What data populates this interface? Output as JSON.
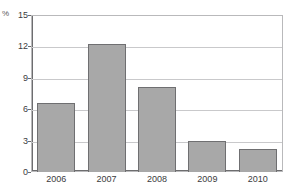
{
  "top_crop_text": "",
  "chart_data": {
    "type": "bar",
    "title": "",
    "subtitle": "",
    "xlabel": "",
    "ylabel": "",
    "unit_label": "%",
    "categories": [
      "2006",
      "2007",
      "2008",
      "2009",
      "2010"
    ],
    "values": [
      6.6,
      12.2,
      8.1,
      2.95,
      2.2
    ],
    "series": [
      {
        "name": "",
        "values": [
          6.6,
          12.2,
          8.1,
          2.95,
          2.2
        ]
      }
    ],
    "ylim": [
      0,
      15
    ],
    "yticks": [
      0,
      3,
      6,
      9,
      12,
      15
    ],
    "ytick_labels": [
      "0",
      "3",
      "6",
      "9",
      "12",
      "15"
    ],
    "grid": true,
    "grid_axis": "y",
    "legend": false,
    "legend_position": "none",
    "bar_color": "#a8a8a8",
    "bar_edge_color": "#6f6f71",
    "gridline_color": "#c9c9cb",
    "axis_color": "#6d6d6f",
    "plot_background": "#ffffff",
    "annotations": []
  }
}
